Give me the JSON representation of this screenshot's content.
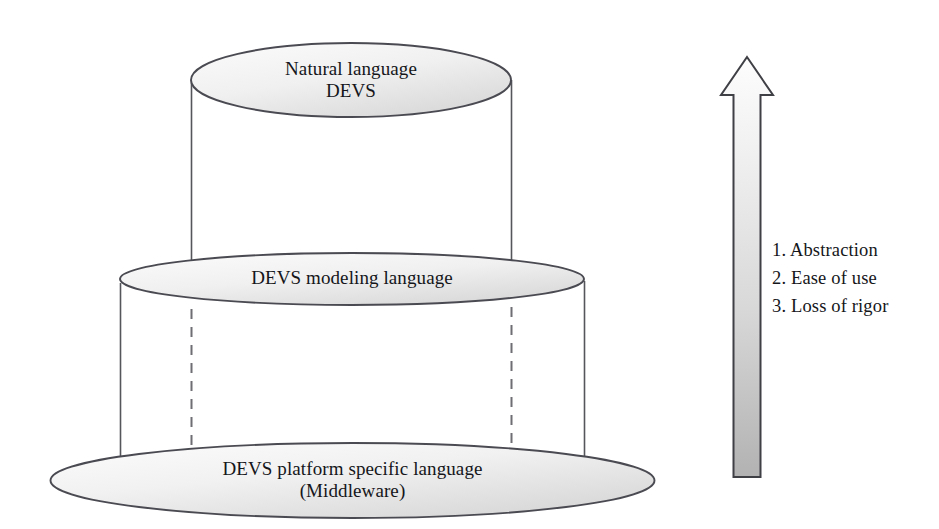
{
  "diagram": {
    "background_color": "#ffffff",
    "stroke_color": "#4a4a52",
    "fill_light": "#f4f4f4",
    "fill_dark": "#d9d9d9",
    "layers": [
      {
        "id": "natural-language-devs",
        "line1": "Natural language",
        "line2": "DEVS"
      },
      {
        "id": "devs-modeling-language",
        "line1": "DEVS modeling language",
        "line2": ""
      },
      {
        "id": "devs-platform-specific-language",
        "line1": "DEVS platform specific language",
        "line2": "(Middleware)"
      }
    ],
    "arrow": {
      "direction": "up",
      "fill_top": "#fbfbfb",
      "fill_bottom": "#b4b4b4",
      "items": [
        "1. Abstraction",
        "2. Ease of use",
        "3. Loss of rigor"
      ]
    }
  }
}
